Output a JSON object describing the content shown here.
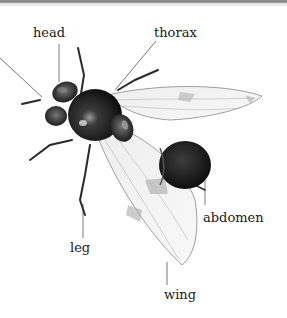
{
  "figure": {
    "labels": [
      {
        "id": "head",
        "text": "head",
        "x": 33,
        "y": 26
      },
      {
        "id": "thorax",
        "text": "thorax",
        "x": 154,
        "y": 26
      },
      {
        "id": "abdomen",
        "text": "abdomen",
        "x": 203,
        "y": 212
      },
      {
        "id": "leg",
        "text": "leg",
        "x": 70,
        "y": 248
      },
      {
        "id": "wing",
        "text": "wing",
        "x": 164,
        "y": 292
      }
    ]
  }
}
